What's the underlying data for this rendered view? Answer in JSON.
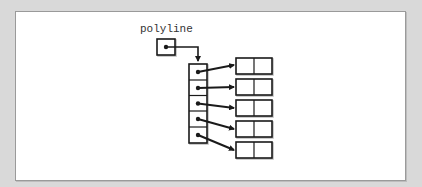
{
  "diagram": {
    "variable_label": "polyline",
    "array_length": 5,
    "point_count": 5,
    "point_fields": 2,
    "colors": {
      "background": "#d9d9d9",
      "panel": "#ffffff",
      "panel_border": "#9a9a9a",
      "stroke": "#1a1a1a",
      "text": "#333333"
    }
  }
}
